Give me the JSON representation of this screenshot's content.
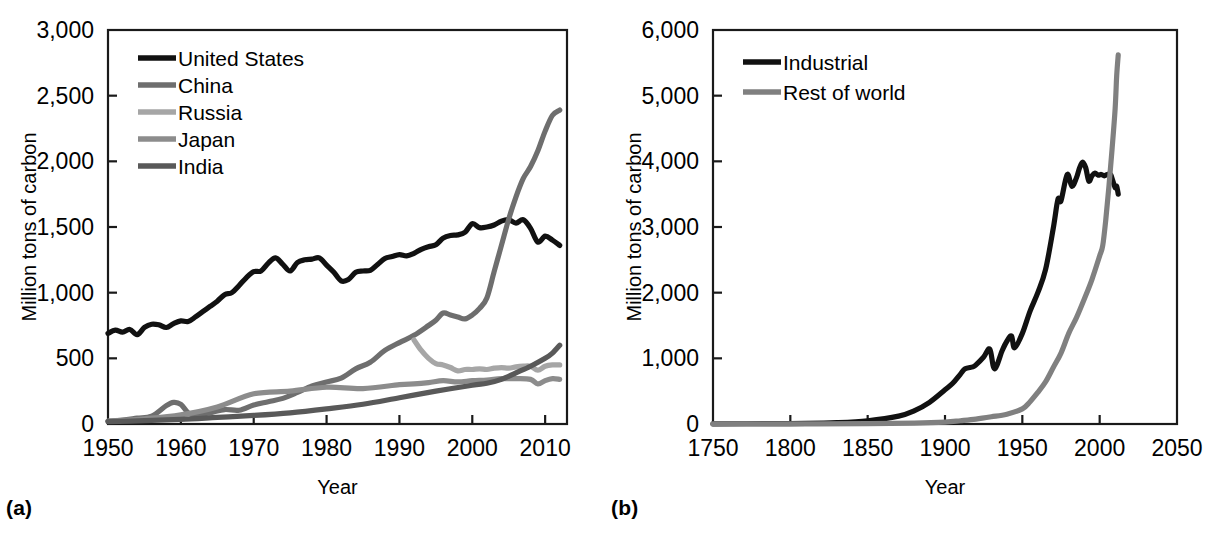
{
  "figure": {
    "panels": [
      {
        "tag": "(a)",
        "axis": {
          "ylabel": "Million tons of carbon",
          "xlabel": "Year",
          "ylim": [
            0,
            3000
          ],
          "yticks": [
            0,
            500,
            1000,
            1500,
            2000,
            2500,
            3000
          ],
          "ytick_labels": [
            "0",
            "500",
            "1,000",
            "1,500",
            "2,000",
            "2,500",
            "3,000"
          ],
          "xlim": [
            1950,
            2013
          ],
          "xticks": [
            1950,
            1960,
            1970,
            1980,
            1990,
            2000,
            2010
          ],
          "xtick_labels": [
            "1950",
            "1960",
            "1970",
            "1980",
            "1990",
            "2000",
            "2010"
          ],
          "grid": false
        },
        "legend": {
          "position": "top-left",
          "entries": [
            {
              "label": "United States",
              "color": "#111111"
            },
            {
              "label": "China",
              "color": "#6e6e6e"
            },
            {
              "label": "Russia",
              "color": "#a6a6a6"
            },
            {
              "label": "Japan",
              "color": "#8c8c8c"
            },
            {
              "label": "India",
              "color": "#595959"
            }
          ]
        }
      },
      {
        "tag": "(b)",
        "axis": {
          "ylabel": "Million tons of carbon",
          "xlabel": "Year",
          "ylim": [
            0,
            6000
          ],
          "yticks": [
            0,
            1000,
            2000,
            3000,
            4000,
            5000,
            6000
          ],
          "ytick_labels": [
            "0",
            "1,000",
            "2,000",
            "3,000",
            "4,000",
            "5,000",
            "6,000"
          ],
          "xlim": [
            1750,
            2050
          ],
          "xticks": [
            1750,
            1800,
            1850,
            1900,
            1950,
            2000,
            2050
          ],
          "xtick_labels": [
            "1750",
            "1800",
            "1850",
            "1900",
            "1950",
            "2000",
            "2050"
          ],
          "grid": false
        },
        "legend": {
          "position": "top-left",
          "entries": [
            {
              "label": "Industrial",
              "color": "#111111"
            },
            {
              "label": "Rest of world",
              "color": "#808080"
            }
          ]
        }
      }
    ]
  },
  "chart_data": [
    {
      "type": "line",
      "panel": "(a)",
      "title": "",
      "xlabel": "Year",
      "ylabel": "Million tons of carbon",
      "xlim": [
        1950,
        2013
      ],
      "ylim": [
        0,
        3000
      ],
      "grid": false,
      "legend_position": "top-left",
      "series": [
        {
          "name": "United States",
          "color": "#111111",
          "x": [
            1950,
            1951,
            1952,
            1953,
            1954,
            1955,
            1956,
            1957,
            1958,
            1959,
            1960,
            1961,
            1962,
            1963,
            1964,
            1965,
            1966,
            1967,
            1968,
            1969,
            1970,
            1971,
            1972,
            1973,
            1974,
            1975,
            1976,
            1977,
            1978,
            1979,
            1980,
            1981,
            1982,
            1983,
            1984,
            1985,
            1986,
            1987,
            1988,
            1989,
            1990,
            1991,
            1992,
            1993,
            1994,
            1995,
            1996,
            1997,
            1998,
            1999,
            2000,
            2001,
            2002,
            2003,
            2004,
            2005,
            2006,
            2007,
            2008,
            2009,
            2010,
            2011,
            2012
          ],
          "values": [
            690,
            715,
            700,
            720,
            680,
            735,
            760,
            755,
            735,
            765,
            785,
            780,
            815,
            855,
            895,
            935,
            985,
            1000,
            1055,
            1115,
            1160,
            1165,
            1225,
            1265,
            1215,
            1165,
            1230,
            1250,
            1255,
            1265,
            1210,
            1155,
            1090,
            1100,
            1155,
            1165,
            1170,
            1215,
            1260,
            1275,
            1290,
            1280,
            1300,
            1330,
            1350,
            1365,
            1415,
            1435,
            1440,
            1460,
            1525,
            1495,
            1500,
            1515,
            1545,
            1555,
            1530,
            1555,
            1490,
            1385,
            1430,
            1400,
            1360
          ]
        },
        {
          "name": "China",
          "color": "#6e6e6e",
          "x": [
            1950,
            1952,
            1954,
            1956,
            1958,
            1959,
            1960,
            1961,
            1962,
            1964,
            1966,
            1968,
            1970,
            1972,
            1974,
            1976,
            1978,
            1980,
            1982,
            1984,
            1986,
            1988,
            1990,
            1992,
            1994,
            1995,
            1996,
            1997,
            1998,
            1999,
            2000,
            2001,
            2002,
            2003,
            2004,
            2005,
            2006,
            2007,
            2008,
            2009,
            2010,
            2011,
            2012
          ],
          "values": [
            21,
            30,
            45,
            60,
            140,
            165,
            150,
            85,
            70,
            85,
            110,
            105,
            145,
            170,
            195,
            240,
            290,
            320,
            350,
            420,
            470,
            560,
            620,
            675,
            750,
            790,
            845,
            830,
            815,
            800,
            830,
            880,
            960,
            1160,
            1360,
            1560,
            1730,
            1870,
            1960,
            2080,
            2230,
            2350,
            2390
          ]
        },
        {
          "name": "Russia",
          "color": "#a6a6a6",
          "x": [
            1992,
            1993,
            1994,
            1995,
            1996,
            1997,
            1998,
            1999,
            2000,
            2001,
            2002,
            2003,
            2004,
            2005,
            2006,
            2007,
            2008,
            2009,
            2010,
            2011,
            2012
          ],
          "values": [
            640,
            560,
            500,
            460,
            450,
            430,
            405,
            415,
            415,
            420,
            415,
            425,
            430,
            425,
            435,
            440,
            440,
            410,
            440,
            450,
            450
          ]
        },
        {
          "name": "Japan",
          "color": "#8c8c8c",
          "x": [
            1950,
            1955,
            1960,
            1965,
            1970,
            1975,
            1980,
            1985,
            1990,
            1992,
            1994,
            1996,
            1998,
            2000,
            2002,
            2004,
            2006,
            2008,
            2009,
            2010,
            2011,
            2012
          ],
          "values": [
            22,
            40,
            70,
            130,
            230,
            250,
            280,
            270,
            300,
            305,
            315,
            330,
            320,
            330,
            335,
            345,
            345,
            340,
            305,
            330,
            345,
            340
          ]
        },
        {
          "name": "India",
          "color": "#595959",
          "x": [
            1950,
            1955,
            1960,
            1965,
            1970,
            1975,
            1980,
            1985,
            1990,
            1995,
            2000,
            2002,
            2004,
            2006,
            2008,
            2010,
            2011,
            2012
          ],
          "values": [
            18,
            25,
            35,
            50,
            65,
            85,
            115,
            150,
            200,
            250,
            295,
            310,
            340,
            390,
            440,
            500,
            540,
            600
          ]
        }
      ]
    },
    {
      "type": "line",
      "panel": "(b)",
      "title": "",
      "xlabel": "Year",
      "ylabel": "Million tons of carbon",
      "xlim": [
        1750,
        2050
      ],
      "ylim": [
        0,
        6000
      ],
      "grid": false,
      "legend_position": "top-left",
      "series": [
        {
          "name": "Industrial",
          "color": "#111111",
          "x": [
            1750,
            1790,
            1810,
            1830,
            1850,
            1870,
            1880,
            1890,
            1900,
            1905,
            1910,
            1913,
            1918,
            1920,
            1925,
            1929,
            1932,
            1937,
            1940,
            1943,
            1945,
            1950,
            1955,
            1960,
            1965,
            1970,
            1973,
            1975,
            1979,
            1982,
            1985,
            1987,
            1989,
            1991,
            1993,
            1995,
            1997,
            1999,
            2001,
            2003,
            2005,
            2007,
            2008,
            2010,
            2011,
            2012
          ],
          "values": [
            3,
            5,
            8,
            20,
            50,
            120,
            200,
            330,
            520,
            620,
            760,
            840,
            870,
            900,
            1020,
            1140,
            840,
            1120,
            1260,
            1340,
            1160,
            1380,
            1720,
            2000,
            2350,
            2980,
            3420,
            3400,
            3800,
            3620,
            3750,
            3900,
            3990,
            3900,
            3700,
            3780,
            3820,
            3790,
            3800,
            3780,
            3800,
            3800,
            3740,
            3600,
            3620,
            3500
          ]
        },
        {
          "name": "Rest of world",
          "color": "#808080",
          "x": [
            1750,
            1800,
            1850,
            1880,
            1900,
            1910,
            1920,
            1930,
            1940,
            1950,
            1955,
            1960,
            1965,
            1970,
            1975,
            1980,
            1985,
            1990,
            1995,
            2000,
            2002,
            2004,
            2006,
            2008,
            2010,
            2011,
            2012
          ],
          "values": [
            1,
            2,
            5,
            12,
            28,
            50,
            75,
            110,
            150,
            230,
            340,
            480,
            640,
            860,
            1080,
            1380,
            1620,
            1900,
            2200,
            2560,
            2720,
            3120,
            3620,
            4180,
            4800,
            5300,
            5620
          ]
        }
      ]
    }
  ]
}
